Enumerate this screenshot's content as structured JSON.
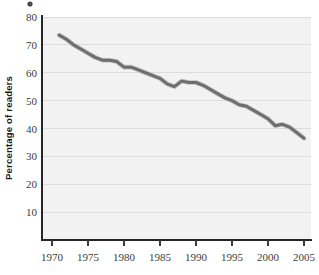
{
  "chart_data": {
    "type": "line",
    "title": "",
    "subtitle": "",
    "xlabel": "",
    "ylabel": "Percentage of readers",
    "xlim": [
      1969,
      2006
    ],
    "ylim": [
      0,
      80
    ],
    "grid": true,
    "legend_position": "none",
    "x_tick_labels": [
      "1970",
      "1975",
      "1980",
      "1985",
      "1990",
      "1995",
      "2000",
      "2005"
    ],
    "x_ticks": [
      1970,
      1975,
      1980,
      1985,
      1990,
      1995,
      2000,
      2005
    ],
    "y_tick_labels": [
      "10",
      "20",
      "30",
      "40",
      "50",
      "60",
      "70",
      "80"
    ],
    "y_ticks": [
      10,
      20,
      30,
      40,
      50,
      60,
      70,
      80
    ],
    "series": [
      {
        "name": "Percentage of readers",
        "color": "#6e6e6e",
        "x": [
          1971,
          1972,
          1973,
          1974,
          1975,
          1976,
          1977,
          1978,
          1979,
          1980,
          1981,
          1982,
          1983,
          1984,
          1985,
          1986,
          1987,
          1988,
          1989,
          1990,
          1991,
          1992,
          1993,
          1994,
          1995,
          1996,
          1997,
          1998,
          1999,
          2000,
          2001,
          2002,
          2003,
          2004,
          2005
        ],
        "values": [
          73.5,
          72.0,
          70.0,
          68.5,
          67.0,
          65.5,
          64.5,
          64.5,
          64.0,
          62.0,
          62.0,
          61.0,
          60.0,
          59.0,
          58.0,
          56.0,
          55.0,
          57.0,
          56.5,
          56.5,
          55.5,
          54.0,
          52.5,
          51.0,
          50.0,
          48.5,
          48.0,
          46.5,
          45.0,
          43.5,
          41.0,
          41.5,
          40.5,
          38.5,
          36.5
        ]
      }
    ],
    "annotations": []
  },
  "axes": {
    "y_axis_title": "Percentage of readers"
  }
}
